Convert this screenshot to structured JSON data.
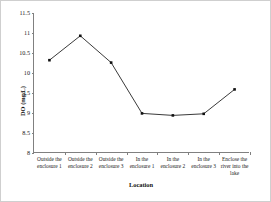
{
  "chart_data": {
    "type": "line",
    "title": "",
    "xlabel": "Location",
    "ylabel": "DO (mg/L)",
    "categories": [
      "Outside the enclosure 1",
      "Outside the enclosure 2",
      "Outside the enclosure 3",
      "In the enclosure 1",
      "In the enclosure 2",
      "In the enclosure 3",
      "Enclose the river into the lake"
    ],
    "values": [
      10.32,
      10.93,
      10.26,
      8.99,
      8.94,
      8.98,
      9.59
    ],
    "series": [
      {
        "name": "DO (mg/L)",
        "values": [
          10.32,
          10.93,
          10.26,
          8.99,
          8.94,
          8.98,
          9.59
        ]
      }
    ],
    "ylim": [
      8,
      11.5
    ],
    "yticks": [
      8,
      8.5,
      9,
      9.5,
      10,
      10.5,
      11,
      11.5
    ],
    "ytick_labels": [
      "8",
      "8.5",
      "9",
      "9.5",
      "10",
      "10.5",
      "11",
      "11.5"
    ],
    "grid": false,
    "legend": "none",
    "marker": "square",
    "line_color": "#3a3a3a",
    "marker_color": "#111111",
    "axis_color": "#808080",
    "background": "#ffffff"
  }
}
